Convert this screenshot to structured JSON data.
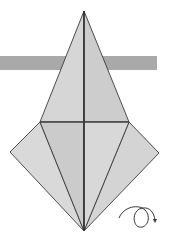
{
  "diagram": {
    "type": "origami-fold-step",
    "colors": {
      "background": "#ffffff",
      "band": "#a9a9a9",
      "paper_light": "#d9d9d9",
      "paper_mid": "#cfcfcf",
      "paper_dark": "#c4c4c4",
      "line": "#3a3a3a"
    },
    "band": {
      "x": 0,
      "y": 56,
      "width": 157,
      "height": 14
    },
    "points": {
      "top": [
        84,
        11
      ],
      "left_inner": [
        40,
        122
      ],
      "right_inner": [
        129,
        122
      ],
      "left_outer": [
        10,
        152
      ],
      "right_outer": [
        159,
        153
      ],
      "bottom": [
        84,
        231
      ]
    },
    "symbols": {
      "turn_over": {
        "icon": "turn-over-arrow-icon",
        "x": 118,
        "y": 204
      }
    }
  }
}
